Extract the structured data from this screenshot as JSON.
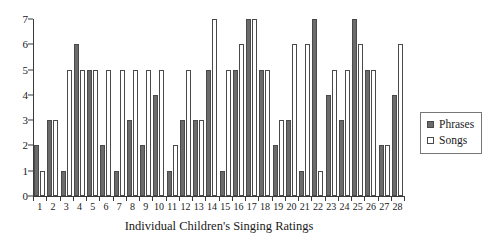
{
  "chart_data": {
    "type": "bar",
    "title": "",
    "xlabel": "Individual Children's Singing Ratings",
    "ylabel": "",
    "ylim": [
      0,
      7
    ],
    "yticks": [
      0,
      1,
      2,
      3,
      4,
      5,
      6,
      7
    ],
    "grid": false,
    "legend_position": "right",
    "categories": [
      "1",
      "2",
      "3",
      "4",
      "5",
      "6",
      "7",
      "8",
      "9",
      "10",
      "11",
      "12",
      "13",
      "14",
      "15",
      "16",
      "17",
      "18",
      "19",
      "20",
      "21",
      "22",
      "23",
      "24",
      "25",
      "26",
      "27",
      "28"
    ],
    "series": [
      {
        "name": "Phrases",
        "color": "#6b6b6b",
        "values": [
          2,
          3,
          1,
          6,
          5,
          2,
          1,
          3,
          2,
          4,
          1,
          3,
          3,
          5,
          1,
          5,
          7,
          5,
          2,
          3,
          1,
          7,
          4,
          3,
          7,
          5,
          2,
          4
        ]
      },
      {
        "name": "Songs",
        "color": "#ffffff",
        "values": [
          1,
          3,
          5,
          5,
          5,
          5,
          5,
          5,
          5,
          5,
          2,
          5,
          3,
          7,
          5,
          6,
          7,
          5,
          3,
          6,
          6,
          1,
          5,
          5,
          6,
          5,
          2,
          6
        ]
      }
    ]
  },
  "legend": {
    "items": [
      {
        "label": "Phrases",
        "swatch": "filled-square-icon"
      },
      {
        "label": "Songs",
        "swatch": "outline-square-icon"
      }
    ]
  }
}
